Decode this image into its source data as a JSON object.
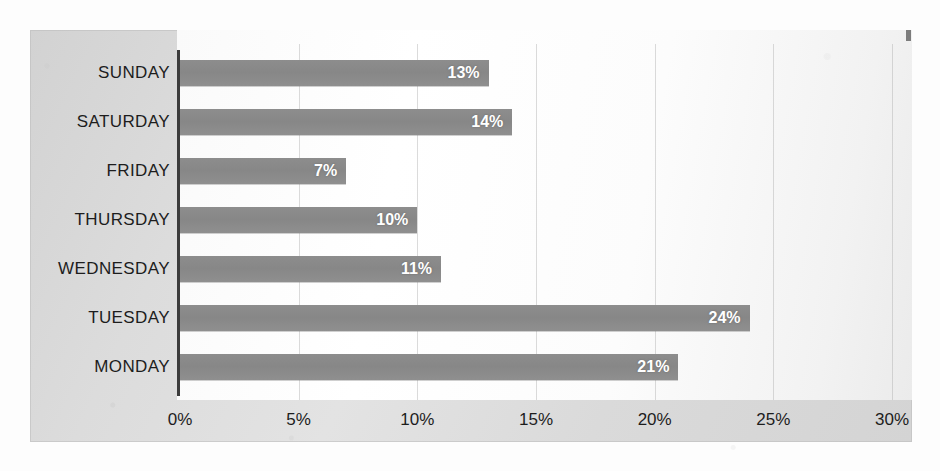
{
  "chart_data": {
    "type": "bar",
    "orientation": "horizontal",
    "title": "",
    "subtitle": "",
    "xlabel": "",
    "ylabel": "",
    "categories": [
      "SUNDAY",
      "SATURDAY",
      "FRIDAY",
      "THURSDAY",
      "WEDNESDAY",
      "TUESDAY",
      "MONDAY"
    ],
    "values": [
      13,
      14,
      7,
      10,
      11,
      24,
      21
    ],
    "data_labels": [
      "13%",
      "14%",
      "7%",
      "10%",
      "11%",
      "24%",
      "21%"
    ],
    "xlim": [
      0,
      30
    ],
    "xtick_values": [
      0,
      5,
      10,
      15,
      20,
      25,
      30
    ],
    "xtick_labels": [
      "0%",
      "5%",
      "10%",
      "15%",
      "20%",
      "25%",
      "30%"
    ],
    "grid": true,
    "grid_axis": "x",
    "legend": false,
    "legend_position": "none",
    "value_unit": "%",
    "colors": {
      "bar": "#8a8a8a",
      "bar_label_text": "#ffffff",
      "plot_background": "#fbfbfb",
      "frame_background": "#d9d9d9",
      "axis_line": "#3c3c3c",
      "gridline": "#afafaf",
      "tick_text": "#1d1d1d",
      "category_text": "#1d1d1d",
      "page_background": "#fdfdfd"
    }
  }
}
